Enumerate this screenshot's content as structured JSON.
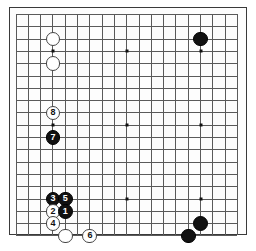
{
  "diagram": {
    "board_size": 19,
    "geometry": {
      "origin_x": 15.5,
      "origin_y": 14.0,
      "cell": 12.3,
      "frame_left": 9,
      "frame_top": 7,
      "frame_width": 238,
      "frame_height": 228
    },
    "colors": {
      "board_background": "#fdfdfd",
      "page_background": "#ffffff",
      "grid_line": "#5a5a5a",
      "frame_line": "#3a3a3a",
      "black_stone": "#111111",
      "white_stone": "#ffffff",
      "white_stone_border": "#444444",
      "star_point": "#111111"
    },
    "star_points": [
      {
        "col": 3,
        "row": 3
      },
      {
        "col": 9,
        "row": 3
      },
      {
        "col": 15,
        "row": 3
      },
      {
        "col": 3,
        "row": 9
      },
      {
        "col": 9,
        "row": 9
      },
      {
        "col": 15,
        "row": 9
      },
      {
        "col": 3,
        "row": 15
      },
      {
        "col": 9,
        "row": 15
      },
      {
        "col": 15,
        "row": 15
      }
    ],
    "stones": [
      {
        "name": "white-stone-top-upper",
        "color": "white",
        "col": 3,
        "row": 2,
        "label": "",
        "radius": 7.4
      },
      {
        "name": "white-stone-top-lower",
        "color": "white",
        "col": 3,
        "row": 4,
        "label": "",
        "radius": 7.4
      },
      {
        "name": "black-stone-top-right",
        "color": "black",
        "col": 15,
        "row": 2,
        "label": "",
        "radius": 7.4
      },
      {
        "name": "white-move-8",
        "color": "white",
        "col": 3,
        "row": 8,
        "label": "8",
        "radius": 7.4
      },
      {
        "name": "black-move-7",
        "color": "black",
        "col": 3,
        "row": 10,
        "label": "7",
        "radius": 7.4
      },
      {
        "name": "black-move-3",
        "color": "black",
        "col": 3,
        "row": 15,
        "label": "3",
        "radius": 7.4
      },
      {
        "name": "black-move-5",
        "color": "black",
        "col": 4,
        "row": 15,
        "label": "5",
        "radius": 7.4
      },
      {
        "name": "white-move-2",
        "color": "white",
        "col": 3,
        "row": 16,
        "label": "2",
        "radius": 7.4
      },
      {
        "name": "black-move-1",
        "color": "black",
        "col": 4,
        "row": 16,
        "label": "1",
        "radius": 7.4
      },
      {
        "name": "white-move-4",
        "color": "white",
        "col": 3,
        "row": 17,
        "label": "4",
        "radius": 7.4
      },
      {
        "name": "white-stone-bottom-left",
        "color": "white",
        "col": 4,
        "row": 18,
        "label": "",
        "radius": 7.4
      },
      {
        "name": "white-move-6",
        "color": "white",
        "col": 6,
        "row": 18,
        "label": "6",
        "radius": 7.4
      },
      {
        "name": "black-stone-bottom-right-lower",
        "color": "black",
        "col": 14,
        "row": 18,
        "label": "",
        "radius": 7.4
      },
      {
        "name": "black-stone-bottom-right-upper",
        "color": "black",
        "col": 15,
        "row": 17,
        "label": "",
        "radius": 7.4
      }
    ]
  }
}
